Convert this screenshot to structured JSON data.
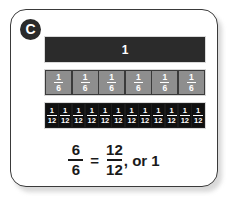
{
  "card": {
    "badge_label": "C",
    "badge_color": "#2b2b2b",
    "border_color": "#3a3a3a",
    "background": "#ffffff"
  },
  "diagram": {
    "type": "fraction-bar-model",
    "rows": [
      {
        "name": "whole",
        "label": "1",
        "parts": 1,
        "fill_color": "#2b2b2b",
        "text_color": "#ffffff"
      },
      {
        "name": "sixths",
        "parts": 6,
        "numerator": "1",
        "denominator": "6",
        "fill_color": "#8e8e8e",
        "text_color": "#ffffff",
        "cells": [
          {
            "num": "1",
            "den": "6"
          },
          {
            "num": "1",
            "den": "6"
          },
          {
            "num": "1",
            "den": "6"
          },
          {
            "num": "1",
            "den": "6"
          },
          {
            "num": "1",
            "den": "6"
          },
          {
            "num": "1",
            "den": "6"
          }
        ]
      },
      {
        "name": "twelfths",
        "parts": 12,
        "numerator": "1",
        "denominator": "12",
        "fill_color": "#101010",
        "text_color": "#ffffff",
        "cells": [
          {
            "num": "1",
            "den": "12"
          },
          {
            "num": "1",
            "den": "12"
          },
          {
            "num": "1",
            "den": "12"
          },
          {
            "num": "1",
            "den": "12"
          },
          {
            "num": "1",
            "den": "12"
          },
          {
            "num": "1",
            "den": "12"
          },
          {
            "num": "1",
            "den": "12"
          },
          {
            "num": "1",
            "den": "12"
          },
          {
            "num": "1",
            "den": "12"
          },
          {
            "num": "1",
            "den": "12"
          },
          {
            "num": "1",
            "den": "12"
          },
          {
            "num": "1",
            "den": "12"
          }
        ]
      }
    ]
  },
  "equation": {
    "left": {
      "num": "6",
      "den": "6"
    },
    "operator": "=",
    "right": {
      "num": "12",
      "den": "12"
    },
    "tail": ", or 1",
    "plain_text": "6/6 = 12/12, or 1"
  }
}
